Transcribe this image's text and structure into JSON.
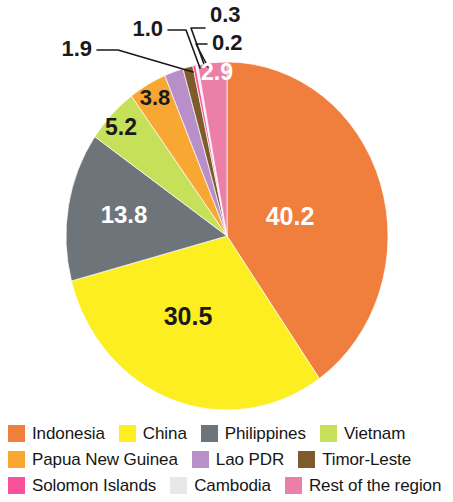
{
  "chart_data": {
    "type": "pie",
    "title": "",
    "subtitle": "",
    "legend_position": "bottom",
    "units": "percent",
    "total": 100.0,
    "start_angle_deg": 0,
    "direction": "clockwise",
    "categories": [
      "Indonesia",
      "China",
      "Philippines",
      "Vietnam",
      "Papua New Guinea",
      "Lao PDR",
      "Timor-Leste",
      "Solomon Islands",
      "Cambodia",
      "Rest of the region"
    ],
    "values": [
      40.2,
      30.5,
      13.8,
      5.2,
      3.8,
      1.9,
      1.0,
      0.3,
      0.2,
      2.9
    ],
    "colors": [
      "#F07E3C",
      "#FCEE21",
      "#6D757B",
      "#C6E05A",
      "#F9A733",
      "#B98FC9",
      "#7E5B2A",
      "#F9529B",
      "#E8E8E8",
      "#EC7FA8"
    ],
    "label_texts": [
      "40.2",
      "30.5",
      "13.8",
      "5.2",
      "3.8",
      "1.9",
      "1.0",
      "0.3",
      "0.2",
      "2.9"
    ],
    "label_colors": [
      "#FFFFFF",
      "#1A1A1A",
      "#FFFFFF",
      "#1A1A1A",
      "#1A1A1A",
      "#1A1A1A",
      "#1A1A1A",
      "#1A1A1A",
      "#1A1A1A",
      "#FFFFFF"
    ],
    "label_placement": [
      "inside",
      "inside",
      "inside",
      "inside",
      "inside",
      "callout",
      "callout",
      "callout",
      "callout",
      "inside"
    ]
  },
  "pie": {
    "inside_labels": [
      {
        "text": "40.2",
        "x": 290,
        "y": 225,
        "fill": "#FFFFFF",
        "size": 25
      },
      {
        "text": "30.5",
        "x": 188,
        "y": 325,
        "fill": "#1A1A1A",
        "size": 25
      },
      {
        "text": "13.8",
        "x": 124,
        "y": 223,
        "fill": "#FFFFFF",
        "size": 24
      },
      {
        "text": "5.2",
        "x": 121,
        "y": 135,
        "fill": "#1A1A1A",
        "size": 23
      },
      {
        "text": "3.8",
        "x": 155,
        "y": 105,
        "fill": "#1A1A1A",
        "size": 22
      },
      {
        "text": "2.9",
        "x": 217,
        "y": 80,
        "fill": "#FFFFFF",
        "size": 23
      }
    ],
    "callouts": [
      {
        "text": "1.9",
        "x": 92,
        "y": 56,
        "anchor": "end",
        "size": 22
      },
      {
        "text": "1.0",
        "x": 163,
        "y": 36,
        "anchor": "end",
        "size": 22
      },
      {
        "text": "0.3",
        "x": 210,
        "y": 22,
        "anchor": "start",
        "size": 22
      },
      {
        "text": "0.2",
        "x": 212,
        "y": 50,
        "anchor": "start",
        "size": 22
      }
    ]
  },
  "legend": {
    "rows": [
      [
        {
          "label": "Indonesia",
          "color": "#F07E3C"
        },
        {
          "label": "China",
          "color": "#FCEE21"
        },
        {
          "label": "Philippines",
          "color": "#6D757B"
        },
        {
          "label": "Vietnam",
          "color": "#C6E05A"
        }
      ],
      [
        {
          "label": "Papua New Guinea",
          "color": "#F9A733"
        },
        {
          "label": "Lao PDR",
          "color": "#B98FC9"
        },
        {
          "label": "Timor-Leste",
          "color": "#7E5B2A"
        }
      ],
      [
        {
          "label": "Solomon Islands",
          "color": "#F9529B"
        },
        {
          "label": "Cambodia",
          "color": "#E8E8E8"
        },
        {
          "label": "Rest of the region",
          "color": "#EC7FA8"
        }
      ]
    ]
  }
}
